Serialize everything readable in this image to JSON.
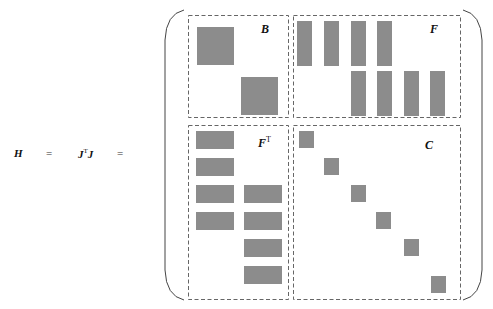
{
  "equation": {
    "lhs": "H",
    "eq1": "=",
    "middle_base": "J",
    "middle_sup": "T",
    "middle_tail": "J",
    "eq2": "="
  },
  "matrix": {
    "blocks": [
      {
        "id": "B",
        "label": "B",
        "label_sup": "",
        "position": "top-left"
      },
      {
        "id": "F",
        "label": "F",
        "label_sup": "",
        "position": "top-right"
      },
      {
        "id": "FT",
        "label": "F",
        "label_sup": "T",
        "position": "bottom-left"
      },
      {
        "id": "C",
        "label": "C",
        "label_sup": "",
        "position": "bottom-right"
      }
    ],
    "colors": {
      "block_fill": "#8c8c8c",
      "dashed_border": "#555555",
      "bracket": "#444444"
    }
  }
}
